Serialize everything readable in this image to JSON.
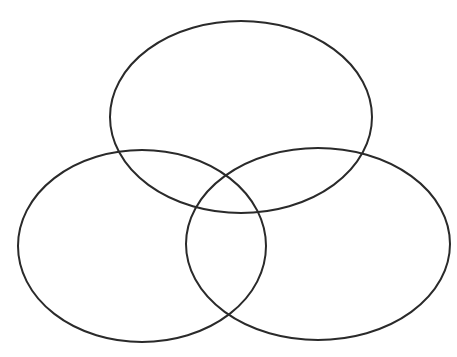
{
  "diagram": {
    "type": "venn",
    "set_count": 3,
    "background": "#ffffff",
    "stroke_color": "#2a2a2a",
    "sets": [
      {
        "id": "top",
        "label": "",
        "cx": 241,
        "cy": 117,
        "rx": 131,
        "ry": 96
      },
      {
        "id": "left",
        "label": "",
        "cx": 142,
        "cy": 246,
        "rx": 124,
        "ry": 96
      },
      {
        "id": "right",
        "label": "",
        "cx": 318,
        "cy": 244,
        "rx": 132,
        "ry": 96
      }
    ]
  }
}
